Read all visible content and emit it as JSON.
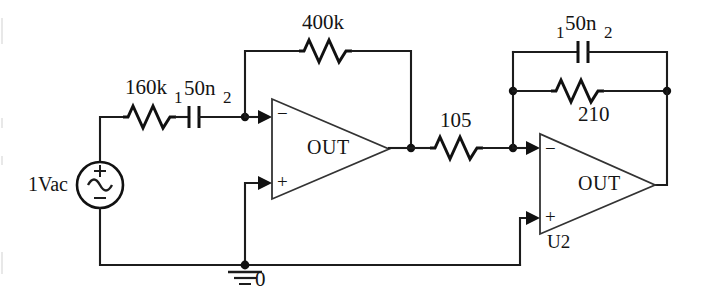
{
  "diagram": {
    "ink_color": "#1c1c1c",
    "background": "#ffffff"
  },
  "source": {
    "label": "1Vac",
    "plus_sign": "+",
    "minus_sign": "−",
    "symbol": "ac-sine-source"
  },
  "ground": {
    "label": "0",
    "symbol": "ground-symbol"
  },
  "components": {
    "r_input": {
      "value": "160k",
      "type": "resistor"
    },
    "c_input": {
      "value": "50n",
      "type": "capacitor",
      "pin1": "1",
      "pin2": "2"
    },
    "r_feedback1": {
      "value": "400k",
      "type": "resistor"
    },
    "r_series": {
      "value": "105",
      "type": "resistor"
    },
    "c_feedback2": {
      "value": "50n",
      "type": "capacitor",
      "pin1": "1",
      "pin2": "2"
    },
    "r_feedback2": {
      "value": "210",
      "type": "resistor"
    }
  },
  "opamp1": {
    "out_label": "OUT",
    "inverting": "−",
    "noninverting": "+",
    "reference": ""
  },
  "opamp2": {
    "out_label": "OUT",
    "inverting": "−",
    "noninverting": "+",
    "reference": "U2"
  }
}
